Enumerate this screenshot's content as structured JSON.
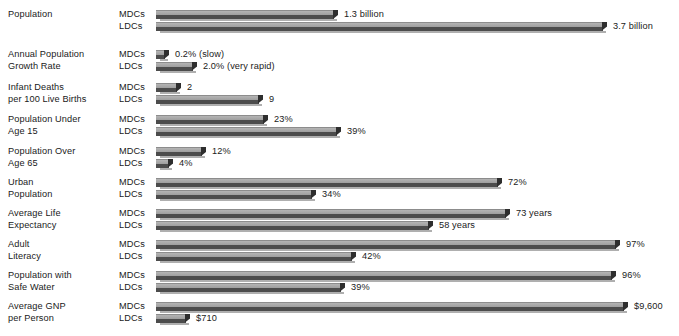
{
  "chart_data": {
    "type": "bar",
    "title": "",
    "subtitle": "",
    "xlabel": "",
    "ylabel": "",
    "orientation": "horizontal",
    "grid": false,
    "legend_position": "inline-row-labels",
    "series_names": [
      "MDCs",
      "LDCs"
    ],
    "categories": [
      "Population",
      "Annual Population Growth Rate",
      "Infant Deaths per 100 Live Births",
      "Population Under Age 15",
      "Population Over Age 65",
      "Urban Population",
      "Average Life Expectancy",
      "Adult Literacy",
      "Population with Safe Water",
      "Average GNP per Person"
    ],
    "rows": [
      {
        "label_line1": "Population",
        "label_line2": "",
        "mdc": {
          "group": "MDCs",
          "value": 1.3,
          "unit": "billion",
          "display": "1.3 billion",
          "bar_px": 182
        },
        "ldc": {
          "group": "LDCs",
          "value": 3.7,
          "unit": "billion",
          "display": "3.7 billion",
          "bar_px": 451
        }
      },
      {
        "label_line1": "Annual Population",
        "label_line2": "Growth Rate",
        "mdc": {
          "group": "MDCs",
          "value": 0.2,
          "unit": "%",
          "display": "0.2% (slow)",
          "bar_px": 13
        },
        "ldc": {
          "group": "LDCs",
          "value": 2.0,
          "unit": "%",
          "display": "2.0% (very rapid)",
          "bar_px": 41
        }
      },
      {
        "label_line1": "Infant Deaths",
        "label_line2": "per 100 Live Births",
        "mdc": {
          "group": "MDCs",
          "value": 2,
          "unit": "",
          "display": "2",
          "bar_px": 25
        },
        "ldc": {
          "group": "LDCs",
          "value": 9,
          "unit": "",
          "display": "9",
          "bar_px": 107
        }
      },
      {
        "label_line1": "Population Under",
        "label_line2": "Age 15",
        "mdc": {
          "group": "MDCs",
          "value": 23,
          "unit": "%",
          "display": "23%",
          "bar_px": 112
        },
        "ldc": {
          "group": "LDCs",
          "value": 39,
          "unit": "%",
          "display": "39%",
          "bar_px": 185
        }
      },
      {
        "label_line1": "Population Over",
        "label_line2": "Age 65",
        "mdc": {
          "group": "MDCs",
          "value": 12,
          "unit": "%",
          "display": "12%",
          "bar_px": 50
        },
        "ldc": {
          "group": "LDCs",
          "value": 4,
          "unit": "%",
          "display": "4%",
          "bar_px": 17
        }
      },
      {
        "label_line1": "Urban",
        "label_line2": "Population",
        "mdc": {
          "group": "MDCs",
          "value": 72,
          "unit": "%",
          "display": "72%",
          "bar_px": 346
        },
        "ldc": {
          "group": "LDCs",
          "value": 34,
          "unit": "%",
          "display": "34%",
          "bar_px": 160
        }
      },
      {
        "label_line1": "Average Life",
        "label_line2": "Expectancy",
        "mdc": {
          "group": "MDCs",
          "value": 73,
          "unit": "years",
          "display": "73 years",
          "bar_px": 354
        },
        "ldc": {
          "group": "LDCs",
          "value": 58,
          "unit": "years",
          "display": "58 years",
          "bar_px": 277
        }
      },
      {
        "label_line1": "Adult",
        "label_line2": "Literacy",
        "mdc": {
          "group": "MDCs",
          "value": 97,
          "unit": "%",
          "display": "97%",
          "bar_px": 464
        },
        "ldc": {
          "group": "LDCs",
          "value": 42,
          "unit": "%",
          "display": "42%",
          "bar_px": 200
        }
      },
      {
        "label_line1": "Population with",
        "label_line2": "Safe Water",
        "mdc": {
          "group": "MDCs",
          "value": 96,
          "unit": "%",
          "display": "96%",
          "bar_px": 460
        },
        "ldc": {
          "group": "LDCs",
          "value": 39,
          "unit": "%",
          "display": "39%",
          "bar_px": 189
        }
      },
      {
        "label_line1": "Average GNP",
        "label_line2": "per Person",
        "mdc": {
          "group": "MDCs",
          "value": 9600,
          "unit": "$",
          "display": "$9,600",
          "bar_px": 472
        },
        "ldc": {
          "group": "LDCs",
          "value": 710,
          "unit": "$",
          "display": "$710",
          "bar_px": 34
        }
      }
    ]
  },
  "colors": {
    "bar_top": "#a8a8a8",
    "bar_front": "#4c4c4c",
    "bar_cap": "#2e2e2e",
    "text": "#1a1a1a",
    "background": "#ffffff"
  }
}
